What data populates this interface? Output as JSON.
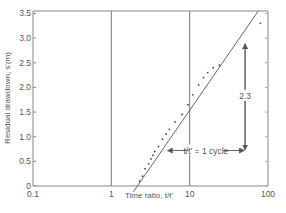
{
  "chart_data": {
    "type": "scatter",
    "title": "",
    "xlabel": "Time ratio, t/t'",
    "ylabel": "Residual drawdown, s'(m)",
    "xscale": "log",
    "xlim": [
      0.1,
      100
    ],
    "ylim": [
      0,
      3.55
    ],
    "xticks": [
      {
        "value": 0.1,
        "label": "0.1"
      },
      {
        "value": 1,
        "label": "1"
      },
      {
        "value": 10,
        "label": "10"
      },
      {
        "value": 100,
        "label": "100"
      }
    ],
    "yticks": [
      {
        "value": 0,
        "label": "0"
      },
      {
        "value": 0.5,
        "label": "0.5"
      },
      {
        "value": 1.0,
        "label": "1.0"
      },
      {
        "value": 1.5,
        "label": "1.5"
      },
      {
        "value": 2.0,
        "label": "2.0"
      },
      {
        "value": 2.5,
        "label": "2.5"
      },
      {
        "value": 3.0,
        "label": "3.0"
      },
      {
        "value": 3.5,
        "label": "3.5"
      }
    ],
    "vertical_gridlines": [
      1,
      10
    ],
    "grid": false,
    "series": [
      {
        "name": "observed residual drawdown",
        "kind": "points",
        "points": [
          [
            2.3,
            0.1
          ],
          [
            2.5,
            0.2
          ],
          [
            2.7,
            0.35
          ],
          [
            3.0,
            0.45
          ],
          [
            3.2,
            0.55
          ],
          [
            3.4,
            0.62
          ],
          [
            3.6,
            0.7
          ],
          [
            4.0,
            0.8
          ],
          [
            4.5,
            0.95
          ],
          [
            5.0,
            1.05
          ],
          [
            5.5,
            1.15
          ],
          [
            6.5,
            1.3
          ],
          [
            8.0,
            1.45
          ],
          [
            9.5,
            1.65
          ],
          [
            11,
            1.85
          ],
          [
            13,
            2.05
          ],
          [
            15,
            2.2
          ],
          [
            17,
            2.3
          ],
          [
            20,
            2.4
          ],
          [
            24,
            2.45
          ],
          [
            80,
            3.3
          ]
        ]
      },
      {
        "name": "fitted straight line",
        "kind": "line",
        "slope_per_log_cycle": 2.3,
        "x_intercept": 2.15
      }
    ],
    "annotations": [
      {
        "type": "vertical-arrow",
        "x": 51,
        "y_from": 2.9,
        "y_to": 0.72,
        "label": "2.3"
      },
      {
        "type": "horizontal-arrow",
        "y": 0.72,
        "x_from": 5.1,
        "x_to": 51,
        "label": "t/t' = 1 cycle"
      }
    ],
    "legend": "none"
  }
}
